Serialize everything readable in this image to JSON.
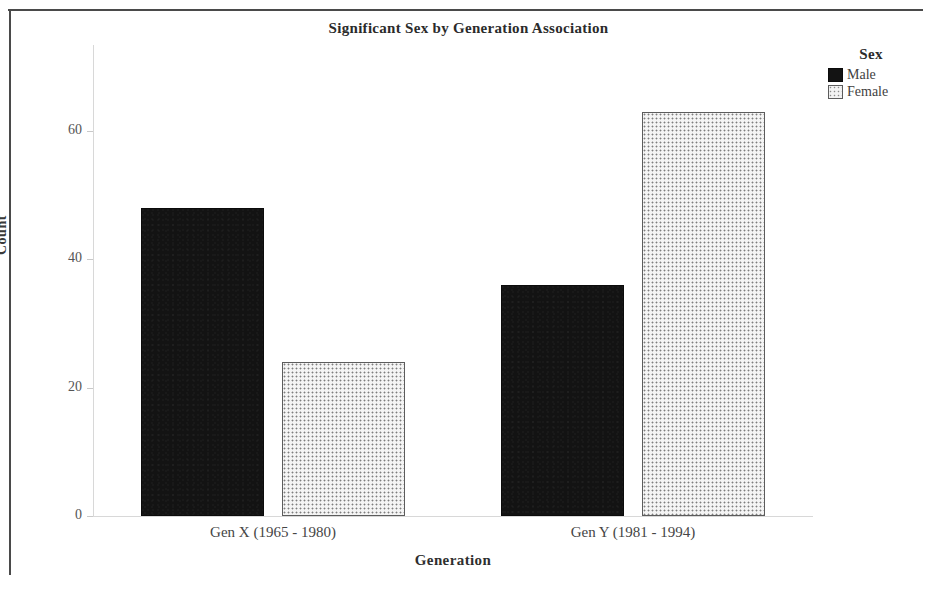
{
  "chart_data": {
    "type": "bar",
    "title": "Significant Sex by Generation Association",
    "xlabel": "Generation",
    "ylabel": "Count",
    "categories": [
      "Gen X (1965 - 1980)",
      "Gen Y (1981 - 1994)"
    ],
    "series": [
      {
        "name": "Male",
        "values": [
          48,
          36
        ],
        "color": "#131313",
        "pattern": "solid-black"
      },
      {
        "name": "Female",
        "values": [
          24,
          63
        ],
        "color": "#f4f4f4",
        "pattern": "dotted-light"
      }
    ],
    "ylim": [
      0,
      66
    ],
    "yticks": [
      0,
      20,
      40,
      60
    ],
    "ytick_labels": [
      "0",
      "20",
      "40",
      "60"
    ],
    "grid": false,
    "legend": {
      "title": "Sex",
      "position": "top-right",
      "entries": [
        "Male",
        "Female"
      ]
    }
  },
  "figure": {
    "title": "Significant Sex by Generation Association",
    "axis_x_title": "Generation",
    "axis_y_title": "Count",
    "frame_color": "#4a4a4a",
    "background": "#ffffff"
  },
  "legend": {
    "title": "Sex",
    "items": [
      {
        "label": "Male",
        "swatch": "black-solid-swatch"
      },
      {
        "label": "Female",
        "swatch": "light-dotted-swatch"
      }
    ]
  },
  "axes": {
    "y_ticks": [
      {
        "label": "60",
        "value": 60
      },
      {
        "label": "40",
        "value": 40
      },
      {
        "label": "20",
        "value": 20
      },
      {
        "label": "0",
        "value": 0
      }
    ],
    "x_categories": [
      {
        "label": "Gen X (1965 - 1980)"
      },
      {
        "label": "Gen Y (1981 - 1994)"
      }
    ]
  }
}
